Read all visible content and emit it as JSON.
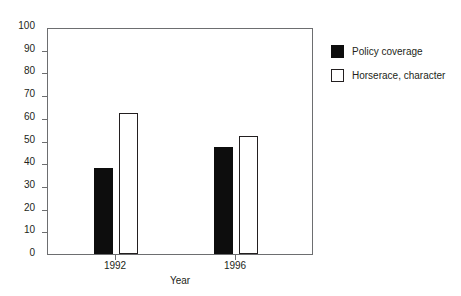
{
  "chart_data": {
    "type": "bar",
    "title": "",
    "xlabel": "Year",
    "ylabel": "",
    "categories": [
      "1992",
      "1996"
    ],
    "series": [
      {
        "name": "Policy coverage",
        "values": [
          38,
          47
        ],
        "color": "#0d0d0d",
        "style": "filled"
      },
      {
        "name": "Horserace, character",
        "values": [
          62,
          52
        ],
        "color": "#ffffff",
        "style": "hollow"
      }
    ],
    "ylim": [
      0,
      100
    ],
    "yticks": [
      0,
      10,
      20,
      30,
      40,
      50,
      60,
      70,
      80,
      90,
      100
    ],
    "ytick_labels": [
      "0",
      "10",
      "20",
      "30",
      "40",
      "50",
      "60",
      "70",
      "80",
      "90",
      "100"
    ],
    "grid": false,
    "legend_position": "right",
    "frame_color": "#6d6e70",
    "text_color": "#231f20",
    "background": "#ffffff"
  },
  "axes": {
    "x_title": "Year",
    "x_tick_labels": [
      "1992",
      "1996"
    ],
    "y_tick_labels": [
      "100",
      "90",
      "80",
      "70",
      "60",
      "50",
      "40",
      "30",
      "20",
      "10",
      "0"
    ]
  },
  "legend": {
    "items": [
      {
        "label": "Policy coverage",
        "style": "filled"
      },
      {
        "label": "Horserace, character",
        "style": "hollow"
      }
    ]
  }
}
